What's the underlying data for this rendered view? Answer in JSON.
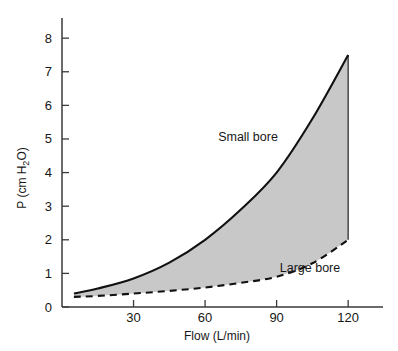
{
  "chart_data": {
    "type": "area",
    "title": "",
    "subtitle": "",
    "xlabel": "Flow (L/min)",
    "ylabel": "P (cm H2O)",
    "ylabel_parts": {
      "prefix": "P (cm H",
      "subscript": "2",
      "suffix": "O)"
    },
    "xlim": [
      0,
      130
    ],
    "ylim": [
      0,
      8.6
    ],
    "x_ticks": [
      30,
      60,
      90,
      120
    ],
    "x_tick_labels": [
      "30",
      "60",
      "90",
      "120"
    ],
    "y_ticks": [
      0,
      1,
      2,
      3,
      4,
      5,
      6,
      7,
      8
    ],
    "y_tick_labels": [
      "0",
      "1",
      "2",
      "3",
      "4",
      "5",
      "6",
      "7",
      "8"
    ],
    "grid": false,
    "legend_position": "inline-annotation",
    "fill_between": true,
    "fill_color": "#c8c8c8",
    "line_color": "#111111",
    "x": [
      5,
      15,
      30,
      45,
      60,
      75,
      90,
      105,
      120
    ],
    "series": [
      {
        "name": "Small bore",
        "style": "solid",
        "values": [
          0.4,
          0.55,
          0.85,
          1.32,
          2.0,
          2.9,
          4.0,
          5.6,
          7.5
        ]
      },
      {
        "name": "Large bore",
        "style": "dashed",
        "values": [
          0.3,
          0.33,
          0.4,
          0.48,
          0.58,
          0.72,
          0.9,
          1.3,
          2.0
        ]
      }
    ],
    "annotations": [
      {
        "text": "Small bore",
        "x": 78,
        "y": 4.95
      },
      {
        "text": "Large bore",
        "x": 104,
        "y": 1.05
      }
    ]
  },
  "axes": {
    "x_axis_name": "flow-axis",
    "y_axis_name": "pressure-axis"
  }
}
